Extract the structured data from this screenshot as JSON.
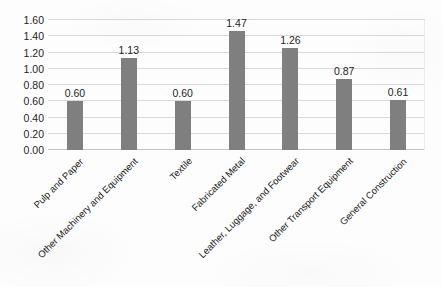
{
  "chart_data": {
    "type": "bar",
    "title": "",
    "subtitle": "",
    "xlabel": "",
    "ylabel": "",
    "legend": [],
    "legend_position": "none",
    "grid": true,
    "grid_axis": "y",
    "ylim": [
      0.0,
      1.6
    ],
    "ytick_step": 0.2,
    "ytick_labels": [
      "0.00",
      "0.20",
      "0.40",
      "0.60",
      "0.80",
      "1.00",
      "1.20",
      "1.40",
      "1.60"
    ],
    "ytick_values": [
      0.0,
      0.2,
      0.4,
      0.6,
      0.8,
      1.0,
      1.2,
      1.4,
      1.6
    ],
    "categories": [
      "Pulp and Paper",
      "Other Machinery and Equipment",
      "Textile",
      "Fabricated Metal",
      "Leather, Luggage, and Footwear",
      "Other Transport Equipment",
      "General Construction"
    ],
    "values": [
      0.6,
      1.13,
      0.6,
      1.47,
      1.26,
      0.87,
      0.61
    ],
    "value_labels": [
      "0.60",
      "1.13",
      "0.60",
      "1.47",
      "1.26",
      "0.87",
      "0.61"
    ],
    "bar_color": "#7f7f7f",
    "gridline_color": "#d9d9d9",
    "text_color": "#1f1f1f",
    "background_color": "#fdfdfd",
    "xlabel_rotation_deg": -45
  }
}
